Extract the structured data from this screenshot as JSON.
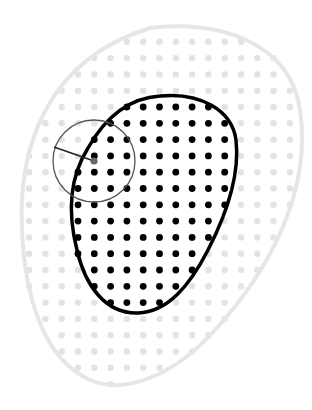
{
  "diagram": {
    "colors": {
      "background": "#ffffff",
      "outer_region_stroke": "#e6e6e6",
      "faint_dot": "#e3e3e3",
      "inner_region_stroke": "#000000",
      "inner_dot": "#000000",
      "circle_stroke": "#555555",
      "radius_line": "#222222",
      "highlight_dot": "#666666"
    },
    "grid": {
      "spacing": 16.3,
      "origin_x": 78,
      "origin_y": 107
    },
    "outer_region": {
      "label": ""
    },
    "inner_region": {
      "label": ""
    },
    "probe_circle": {
      "cx": 94,
      "cy": 161,
      "r": 41,
      "radius_end_x": 54,
      "radius_end_y": 147
    }
  }
}
